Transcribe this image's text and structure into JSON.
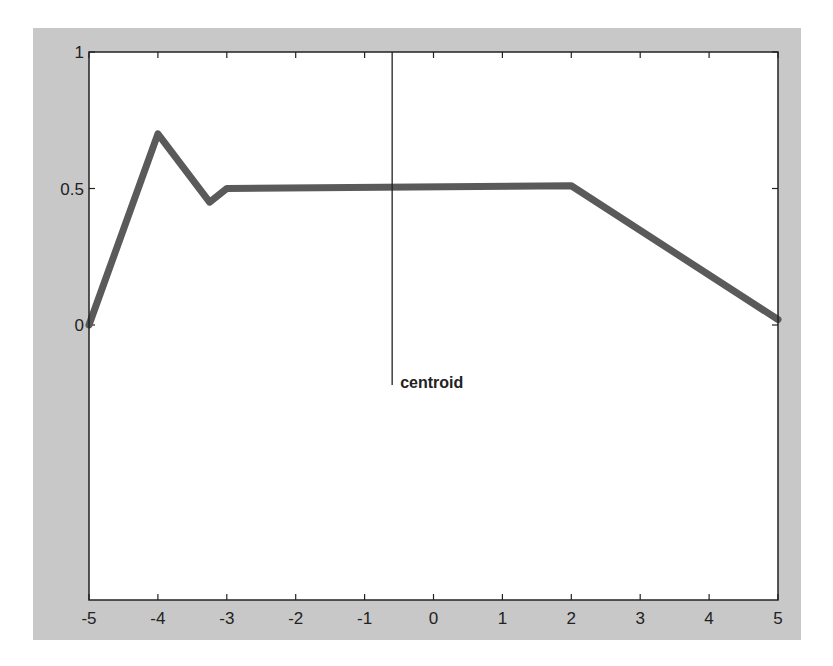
{
  "chart_data": {
    "type": "line",
    "title": "",
    "xlabel": "",
    "ylabel": "",
    "xlim": [
      -5,
      5
    ],
    "ylim": [
      0,
      1
    ],
    "grid": false,
    "legend": null,
    "x_ticks": [
      "-5",
      "-4",
      "-3",
      "-2",
      "-1",
      "0",
      "1",
      "2",
      "3",
      "4",
      "5"
    ],
    "y_ticks": [
      "0",
      "0.5",
      "1"
    ],
    "series": [
      {
        "name": "aggregated membership",
        "color": "#5a5a5a",
        "x": [
          -5,
          -4,
          -3.25,
          -3,
          2,
          5
        ],
        "y": [
          0,
          0.7,
          0.45,
          0.5,
          0.51,
          0.02
        ]
      }
    ],
    "annotations": [
      {
        "type": "vline",
        "x": -0.6,
        "y_from": 1,
        "y_to": -0.22,
        "label": "centroid"
      }
    ]
  },
  "colors": {
    "figure_background": "#c8c8c8",
    "axes_background": "#ffffff",
    "line": "#5a5a5a",
    "axes": "#222222"
  }
}
